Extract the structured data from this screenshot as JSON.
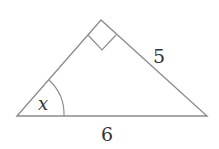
{
  "diagram": {
    "type": "right-triangle",
    "stroke_color": "#8a8a8a",
    "labels": {
      "angle": "x",
      "hypotenuse_side": "5",
      "base": "6"
    }
  }
}
